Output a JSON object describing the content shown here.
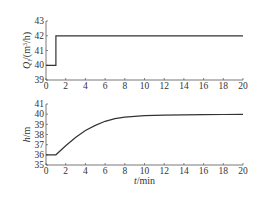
{
  "chart_data": [
    {
      "type": "line",
      "title": "",
      "xlabel": "",
      "ylabel": "Q_i/(m³/h)",
      "ylabel_parts": {
        "main": "Q",
        "sub": "i",
        "unit": "/(m",
        "sup": "3",
        "unit2": "/h)"
      },
      "xlim": [
        0,
        20
      ],
      "ylim": [
        39,
        43
      ],
      "xticks": [
        "0",
        "2",
        "4",
        "6",
        "8",
        "10",
        "12",
        "14",
        "16",
        "18",
        "20"
      ],
      "yticks": [
        "39",
        "40",
        "41",
        "42",
        "43"
      ],
      "grid": false,
      "series": [
        {
          "name": "Qi",
          "x": [
            0,
            1,
            1,
            20
          ],
          "y": [
            40,
            40,
            42,
            42
          ]
        }
      ]
    },
    {
      "type": "line",
      "title": "",
      "xlabel": "t/min",
      "xlabel_parts": {
        "main": "t",
        "unit": "/min"
      },
      "ylabel": "h/m",
      "ylabel_parts": {
        "main": "h",
        "unit": "/m"
      },
      "xlim": [
        0,
        20
      ],
      "ylim": [
        35,
        41
      ],
      "xticks": [
        "0",
        "2",
        "4",
        "6",
        "8",
        "10",
        "12",
        "14",
        "16",
        "18",
        "20"
      ],
      "yticks": [
        "35",
        "36",
        "37",
        "38",
        "39",
        "40",
        "41"
      ],
      "grid": false,
      "series": [
        {
          "name": "h",
          "x": [
            0,
            1,
            2,
            3,
            4,
            5,
            6,
            7,
            8,
            10,
            12,
            14,
            16,
            18,
            20
          ],
          "y": [
            36,
            36,
            36.9,
            37.7,
            38.4,
            38.9,
            39.3,
            39.55,
            39.7,
            39.85,
            39.9,
            39.93,
            39.95,
            39.97,
            39.98
          ]
        }
      ]
    }
  ]
}
